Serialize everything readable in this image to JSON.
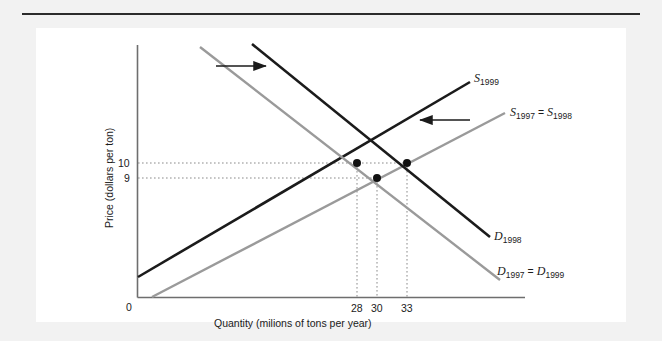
{
  "figure": {
    "background": "#f2f2f2",
    "panel_background": "#ffffff",
    "rule_color": "#2b2b2b"
  },
  "axes": {
    "origin_label": "0",
    "x_title": "Quantity (milions of tons per year)",
    "y_title": "Price (dollars per ton)",
    "axis_color": "#6e6e6e"
  },
  "chart_data": {
    "type": "line",
    "title": "",
    "xlabel": "Quantity (milions of tons per year)",
    "ylabel": "Price (dollars per ton)",
    "grid": false,
    "legend": "inline-curve-labels",
    "x_ticks": [
      {
        "value": 28,
        "label": "28",
        "px": 357
      },
      {
        "value": 30,
        "label": "30",
        "px": 377
      },
      {
        "value": 33,
        "label": "33",
        "px": 407
      }
    ],
    "y_ticks": [
      {
        "value": 10,
        "label": "10",
        "px": 163
      },
      {
        "value": 9,
        "label": "9",
        "px": 178
      }
    ],
    "series": [
      {
        "name": "S_1997 = S_1998",
        "role": "supply",
        "color": "#9a9a9a",
        "label_html": "S<sub>1997</sub> <span class=\"eq\">=</span> S<sub>1998</sub>",
        "x1": 152,
        "y1": 297,
        "x2": 505,
        "y2": 113
      },
      {
        "name": "S_1999",
        "role": "supply",
        "color": "#1b1b1b",
        "label_html": "S<sub>1999</sub>",
        "x1": 138,
        "y1": 277,
        "x2": 470,
        "y2": 82
      },
      {
        "name": "D_1997 = D_1999",
        "role": "demand",
        "color": "#9a9a9a",
        "label_html": "D<sub>1997</sub> <span class=\"eq\">=</span> D<sub>1999</sub>",
        "x1": 200,
        "y1": 47,
        "x2": 500,
        "y2": 280
      },
      {
        "name": "D_1998",
        "role": "demand",
        "color": "#1b1b1b",
        "label_html": "D<sub>1998</sub>",
        "x1": 252,
        "y1": 44,
        "x2": 490,
        "y2": 237
      }
    ],
    "equilibria": [
      {
        "name": "1997",
        "quantity": 28,
        "price": 10,
        "px": 357,
        "py": 163
      },
      {
        "name": "1998",
        "quantity": 30,
        "price": 9,
        "px": 377,
        "py": 178
      },
      {
        "name": "1999",
        "quantity": 33,
        "price": 10,
        "px": 407,
        "py": 163
      }
    ],
    "annotations": [
      {
        "name": "demand-shift-arrow",
        "direction": "right",
        "x1": 216,
        "y1": 66,
        "x2": 268,
        "y2": 66
      },
      {
        "name": "supply-shift-arrow",
        "direction": "left",
        "x1": 470,
        "y1": 120,
        "x2": 418,
        "y2": 120
      }
    ]
  },
  "curve_labels": {
    "s1999": {
      "x": 474,
      "y": 72
    },
    "s1997_s1998": {
      "x": 510,
      "y": 105
    },
    "d1998": {
      "x": 494,
      "y": 230
    },
    "d1997_d1999": {
      "x": 497,
      "y": 265
    }
  }
}
